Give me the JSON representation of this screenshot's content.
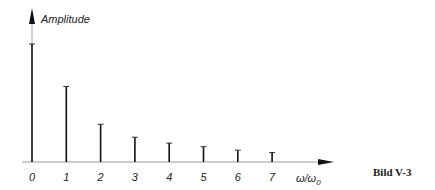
{
  "chart_data": {
    "type": "bar",
    "title": "",
    "xlabel": "ω/ω0",
    "ylabel": "Amplitude",
    "categories": [
      "0",
      "1",
      "2",
      "3",
      "4",
      "5",
      "6",
      "7"
    ],
    "values": [
      1.0,
      0.64,
      0.32,
      0.21,
      0.16,
      0.13,
      0.1,
      0.08
    ],
    "grid": false,
    "legend": "none"
  },
  "figure": {
    "caption": "Bild V-3",
    "ylabel": "Amplitude",
    "xlabel_main": "ω/ω",
    "xlabel_sub": "0"
  }
}
